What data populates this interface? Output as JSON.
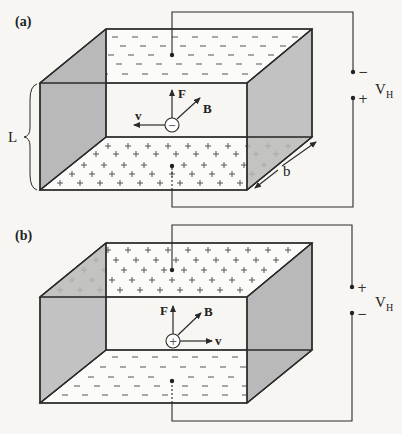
{
  "figure": {
    "panels": [
      {
        "id": "a",
        "label": "(a)",
        "top_plate_charge": "−",
        "bottom_plate_charge": "+",
        "carrier_sign": "−",
        "vectors": {
          "force": "F",
          "field": "B",
          "velocity": "v"
        },
        "dimension_labels": {
          "height": "L",
          "depth": "b"
        },
        "voltage": {
          "label": "V",
          "subscript": "H",
          "upper_terminal": "−",
          "lower_terminal": "+"
        }
      },
      {
        "id": "b",
        "label": "(b)",
        "top_plate_charge": "+",
        "bottom_plate_charge": "−",
        "carrier_sign": "+",
        "vectors": {
          "force": "F",
          "field": "B",
          "velocity": "v"
        },
        "voltage": {
          "label": "V",
          "subscript": "H",
          "upper_terminal": "+",
          "lower_terminal": "−"
        }
      }
    ],
    "colors": {
      "face_shade": "#b9b9b9",
      "line": "#2a2a2a",
      "background": "#f7f6f3"
    }
  }
}
